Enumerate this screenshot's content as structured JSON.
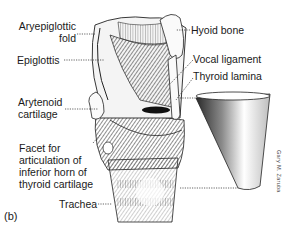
{
  "figure": {
    "panel_letter": "(b)",
    "artist_signature": "Gary M. Zaruba",
    "labels_left": [
      {
        "id": "aryepiglottic-fold",
        "line1": "Aryepiglottic",
        "line2": "fold"
      },
      {
        "id": "epiglottis",
        "text": "Epiglottis"
      },
      {
        "id": "arytenoid-cartilage",
        "line1": "Arytenoid",
        "line2": "cartilage"
      },
      {
        "id": "facet",
        "line1": "Facet for",
        "line2": "articulation of",
        "line3": "inferior horn of",
        "line4": "thyroid cartilage"
      },
      {
        "id": "trachea",
        "text": "Trachea"
      }
    ],
    "labels_right": [
      {
        "id": "hyoid-bone",
        "text": "Hyoid bone"
      },
      {
        "id": "vocal-ligament",
        "text": "Vocal ligament"
      },
      {
        "id": "thyroid-lamina",
        "text": "Thyroid lamina"
      }
    ],
    "colors": {
      "ink": "#1a1a1a",
      "background": "#ffffff",
      "shade": "#8a8a8a"
    }
  }
}
